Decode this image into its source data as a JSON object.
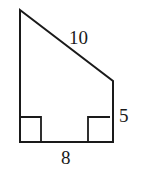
{
  "figure": {
    "type": "right trapezoid",
    "labels": {
      "slant_side": "10",
      "right_side": "5",
      "bottom_side": "8"
    },
    "right_angles": [
      "bottom-left",
      "bottom-right"
    ],
    "stroke_color": "#1a1a1a",
    "background": "#ffffff"
  }
}
